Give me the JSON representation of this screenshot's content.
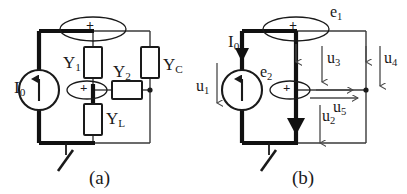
{
  "figure": {
    "kind": "electrical-circuit-diagram",
    "panels": [
      {
        "id": "a",
        "caption": "(a)",
        "description": "Circuit with admittances"
      },
      {
        "id": "b",
        "caption": "(b)",
        "description": "Graph with node and branch voltages"
      }
    ]
  },
  "panel_a": {
    "caption": "(a)",
    "source_label": "I",
    "source_sub": "0",
    "source_icon": "current-source-arrow-up",
    "ground_icon": "ground-slash",
    "polarity_marks": [
      "+",
      "+"
    ],
    "components": [
      {
        "name": "Y",
        "sub": "1",
        "label": "Y1",
        "orientation": "vertical",
        "icon": "resistor-box"
      },
      {
        "name": "Y",
        "sub": "2",
        "label": "Y2",
        "orientation": "horizontal",
        "icon": "resistor-box"
      },
      {
        "name": "Y",
        "sub": "C",
        "label": "YC",
        "orientation": "vertical",
        "icon": "resistor-box"
      },
      {
        "name": "Y",
        "sub": "L",
        "label": "YL",
        "orientation": "vertical",
        "icon": "resistor-box"
      }
    ]
  },
  "panel_b": {
    "caption": "(b)",
    "source_label": "I",
    "source_sub": "0",
    "source_icon": "current-source-arrow-up",
    "ground_icon": "ground-slash",
    "polarity_marks": [
      "+",
      "+"
    ],
    "node_voltages": [
      {
        "name": "e",
        "sub": "1",
        "label": "e1"
      },
      {
        "name": "e",
        "sub": "2",
        "label": "e2"
      }
    ],
    "branch_voltages": [
      {
        "name": "u",
        "sub": "1",
        "label": "u1",
        "arrow": "down"
      },
      {
        "name": "u",
        "sub": "2",
        "label": "u2",
        "arrow": "down"
      },
      {
        "name": "u",
        "sub": "3",
        "label": "u3",
        "arrow": "down"
      },
      {
        "name": "u",
        "sub": "4",
        "label": "u4",
        "arrow": "down"
      },
      {
        "name": "u",
        "sub": "5",
        "label": "u5",
        "arrow": "right"
      }
    ],
    "current_label": {
      "name": "I",
      "sub": "0",
      "label": "I0",
      "arrow": "up"
    }
  },
  "colors": {
    "ink": "#1a1a1a",
    "thick_wire": "#111111",
    "thin_wire": "#3a3a3a",
    "background": "#ffffff",
    "fill": "#ffffff"
  }
}
